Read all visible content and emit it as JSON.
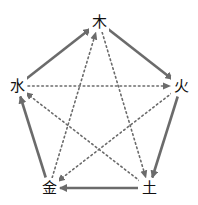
{
  "diagram": {
    "type": "five-elements-cycle",
    "colors": {
      "line": "#6b6b6b",
      "text": "#111111",
      "background": "#ffffff"
    },
    "nodes": [
      {
        "id": "wood",
        "label": "木",
        "x": 99,
        "y": 22
      },
      {
        "id": "fire",
        "label": "火",
        "x": 181,
        "y": 86
      },
      {
        "id": "earth",
        "label": "土",
        "x": 149,
        "y": 188
      },
      {
        "id": "metal",
        "label": "金",
        "x": 49,
        "y": 188
      },
      {
        "id": "water",
        "label": "水",
        "x": 17,
        "y": 86
      }
    ],
    "generating_edges": [
      {
        "from": "wood",
        "to": "fire",
        "style": "solid"
      },
      {
        "from": "fire",
        "to": "earth",
        "style": "solid"
      },
      {
        "from": "earth",
        "to": "metal",
        "style": "solid"
      },
      {
        "from": "metal",
        "to": "water",
        "style": "solid"
      },
      {
        "from": "water",
        "to": "wood",
        "style": "solid"
      }
    ],
    "controlling_edges": [
      {
        "from": "wood",
        "to": "earth",
        "style": "dotted"
      },
      {
        "from": "earth",
        "to": "water",
        "style": "dotted"
      },
      {
        "from": "water",
        "to": "fire",
        "style": "dotted"
      },
      {
        "from": "fire",
        "to": "metal",
        "style": "dotted"
      },
      {
        "from": "metal",
        "to": "wood",
        "style": "dotted"
      }
    ]
  }
}
